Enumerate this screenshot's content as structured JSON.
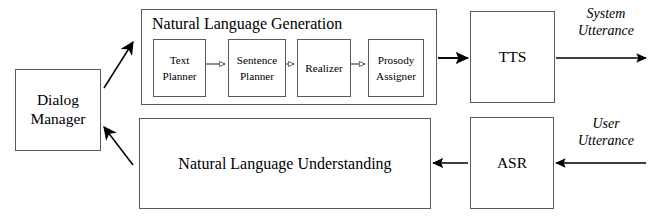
{
  "diagram": {
    "type": "block-flow-diagram",
    "background_color": "#ffffff",
    "line_color": "#5a5a5a",
    "arrow_color": "#000000",
    "nodes": {
      "dialog_manager": {
        "label": "Dialog\nManager"
      },
      "nlg": {
        "title": "Natural Language Generation"
      },
      "text_planner": {
        "label": "Text\nPlanner"
      },
      "sentence_planner": {
        "label": "Sentence\nPlanner"
      },
      "realizer": {
        "label": "Realizer"
      },
      "prosody_assigner": {
        "label": "Prosody\nAssigner"
      },
      "tts": {
        "label": "TTS"
      },
      "nlu": {
        "label": "Natural Language Understanding"
      },
      "asr": {
        "label": "ASR"
      }
    },
    "edge_labels": {
      "system_utterance": "System\nUtterance",
      "user_utterance": "User\nUtterance"
    },
    "edges": [
      {
        "from": "dialog_manager",
        "to": "nlg",
        "style": "diagonal-solid-filled-arrow"
      },
      {
        "from": "text_planner",
        "to": "sentence_planner",
        "style": "short-hollow-arrow"
      },
      {
        "from": "sentence_planner",
        "to": "realizer",
        "style": "short-hollow-arrow"
      },
      {
        "from": "realizer",
        "to": "prosody_assigner",
        "style": "short-hollow-arrow"
      },
      {
        "from": "nlg",
        "to": "tts",
        "style": "solid-filled-arrow"
      },
      {
        "from": "tts",
        "to": "system_utterance",
        "style": "solid-filled-arrow"
      },
      {
        "from": "user_utterance",
        "to": "asr",
        "style": "solid-filled-arrow"
      },
      {
        "from": "asr",
        "to": "nlu",
        "style": "solid-filled-arrow"
      },
      {
        "from": "nlu",
        "to": "dialog_manager",
        "style": "diagonal-solid-filled-arrow"
      }
    ]
  }
}
